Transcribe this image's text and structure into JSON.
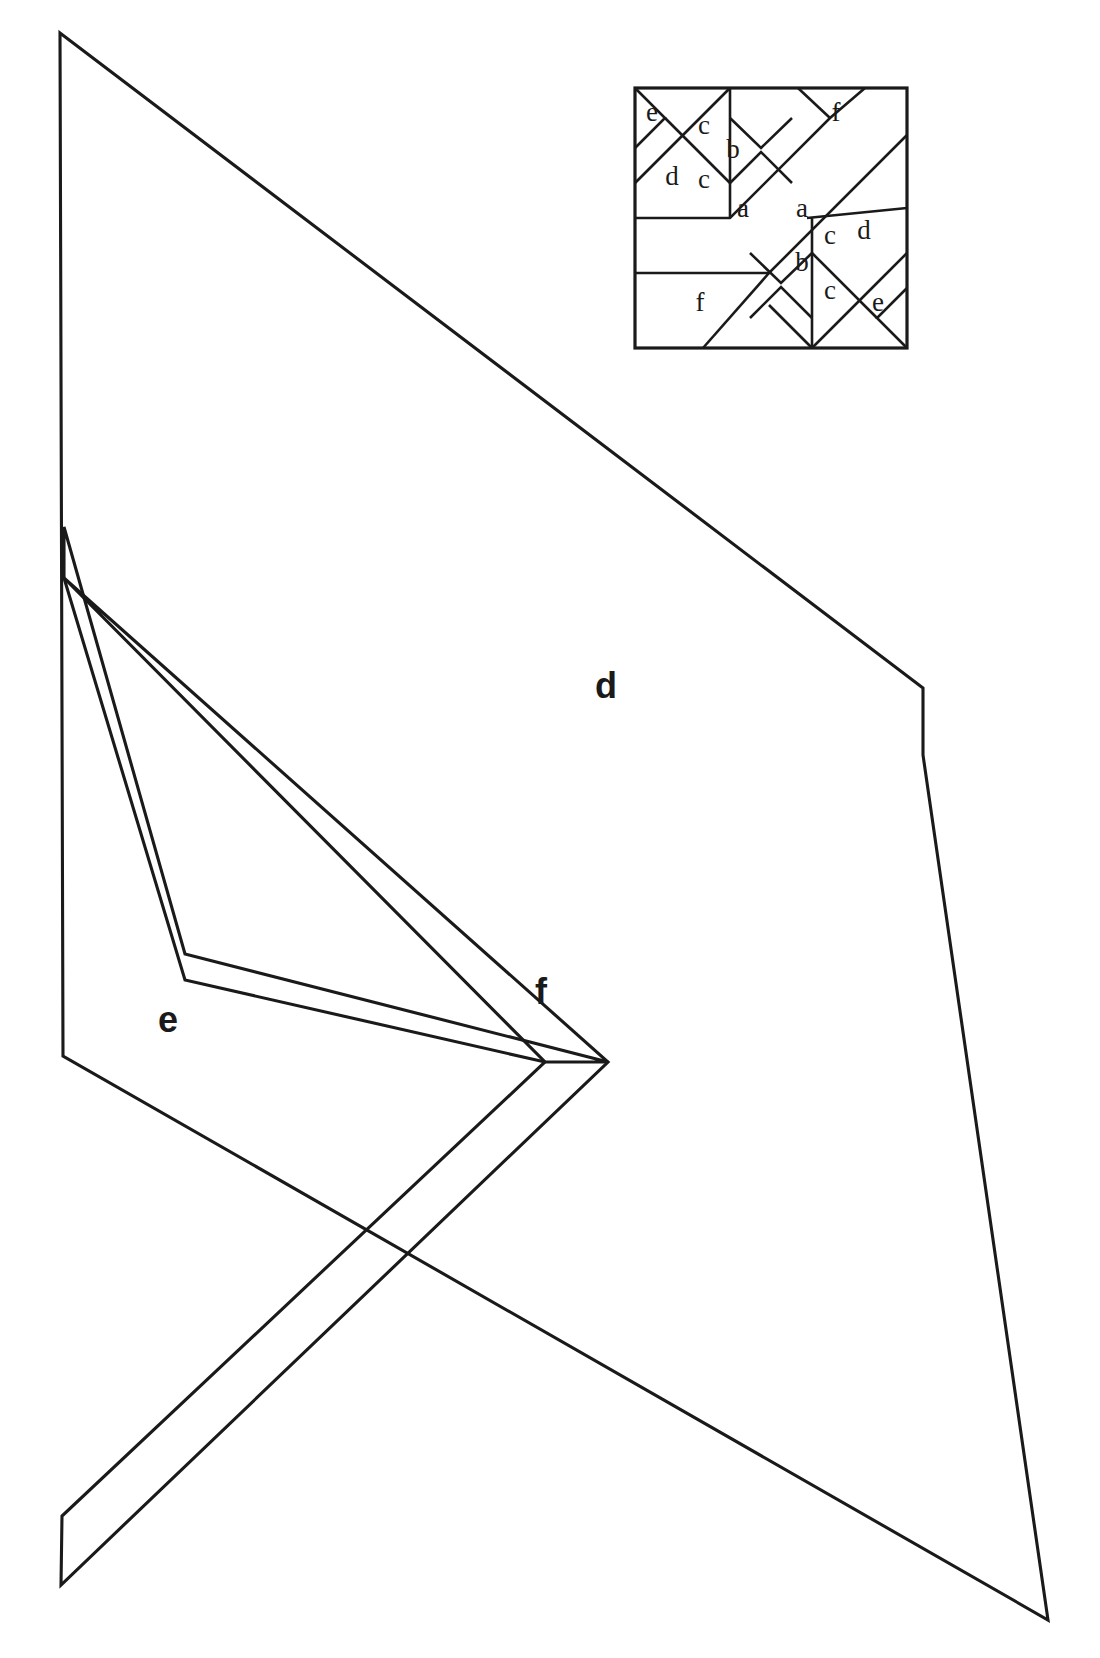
{
  "figure": {
    "kind": "geometric-dissection-diagram",
    "background_color": "#ffffff",
    "line_color": "#1a1a1a",
    "canvas": {
      "width": 1100,
      "height": 1658
    }
  },
  "main": {
    "labels": [
      {
        "id": "main-label-d",
        "text": "d",
        "x": 606,
        "y": 698
      },
      {
        "id": "main-label-e",
        "text": "e",
        "x": 168,
        "y": 1032
      },
      {
        "id": "main-label-f",
        "text": "f",
        "x": 541,
        "y": 1004
      }
    ],
    "pieces": [
      {
        "id": "piece-d",
        "label": "d",
        "points": "60,33 923,688 923,755 1048,1620 63,1056"
      },
      {
        "id": "piece-e",
        "label": "e",
        "points": "64,527 185,954 608,1062 545,1062 185,980 64,578"
      },
      {
        "id": "piece-f",
        "label": "f",
        "points": "64,578 545,1062 62,1516 61,1585 608,1062"
      }
    ]
  },
  "inset": {
    "title": "square-dissection-key",
    "frame": {
      "x": 5,
      "y": 4,
      "width": 272,
      "height": 260
    },
    "labels": [
      {
        "id": "inset-label-e-top",
        "text": "e",
        "x": 22,
        "y": 37
      },
      {
        "id": "inset-label-f-top",
        "text": "f",
        "x": 206,
        "y": 37
      },
      {
        "id": "inset-label-c-upper-left",
        "text": "c",
        "x": 74,
        "y": 50
      },
      {
        "id": "inset-label-b-upper",
        "text": "b",
        "x": 103,
        "y": 74
      },
      {
        "id": "inset-label-d-upper",
        "text": "d",
        "x": 42,
        "y": 101
      },
      {
        "id": "inset-label-c-upper-lower",
        "text": "c",
        "x": 74,
        "y": 104
      },
      {
        "id": "inset-label-a-left",
        "text": "a",
        "x": 113,
        "y": 133
      },
      {
        "id": "inset-label-a-right",
        "text": "a",
        "x": 172,
        "y": 133
      },
      {
        "id": "inset-label-c-lower-upper",
        "text": "c",
        "x": 200,
        "y": 160
      },
      {
        "id": "inset-label-d-lower",
        "text": "d",
        "x": 234,
        "y": 155
      },
      {
        "id": "inset-label-b-lower",
        "text": "b",
        "x": 172,
        "y": 187
      },
      {
        "id": "inset-label-f-bottom",
        "text": "f",
        "x": 70,
        "y": 227
      },
      {
        "id": "inset-label-c-lower-lower",
        "text": "c",
        "x": 200,
        "y": 215
      },
      {
        "id": "inset-label-e-bottom",
        "text": "e",
        "x": 248,
        "y": 227
      }
    ],
    "cuts": [
      {
        "id": "cut-e-top",
        "d": "M 5 4 L 35 34 L 5 64"
      },
      {
        "id": "cut-d-top-diag",
        "d": "M 35 34 L 100 99"
      },
      {
        "id": "cut-a-top-long",
        "d": "M 100 4 L 35 69 L 5 99"
      },
      {
        "id": "cut-a-upper-band",
        "d": "M 100 4 L 100 134"
      },
      {
        "id": "cut-b-upper-upper",
        "d": "M 100 34 L 131 64 L 162 34"
      },
      {
        "id": "cut-b-upper-lower",
        "d": "M 100 99 L 131 68 L 162 99"
      },
      {
        "id": "cut-band-a-upper",
        "d": "M 5 134 L 100 134 L 200 34 L 235 4"
      },
      {
        "id": "cut-band-a-lower",
        "d": "M 5 189 L 139 189 L 277 51"
      },
      {
        "id": "cut-f-top-right",
        "d": "M 168 4 L 200 34"
      },
      {
        "id": "cut-d-right-diag",
        "d": "M 277 124 L 177 134"
      },
      {
        "id": "cut-f-bottom-left",
        "d": "M 73 264 L 139 189"
      },
      {
        "id": "cut-e-bottom",
        "d": "M 277 264 L 247 234 L 277 204"
      },
      {
        "id": "cut-d-bottom-diag",
        "d": "M 247 234 L 182 169"
      },
      {
        "id": "cut-a-lower-band",
        "d": "M 182 134 L 182 264"
      },
      {
        "id": "cut-b-lower-upper",
        "d": "M 182 169 L 151 199 L 120 169"
      },
      {
        "id": "cut-b-lower-lower",
        "d": "M 182 234 L 151 203 L 120 234"
      },
      {
        "id": "cut-a-bottom-long",
        "d": "M 182 264 L 247 199 L 277 169"
      },
      {
        "id": "cut-f-bottom-diag",
        "d": "M 182 264 L 139 221"
      }
    ]
  }
}
